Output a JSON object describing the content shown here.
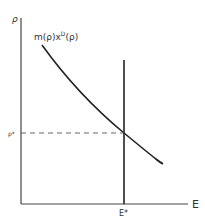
{
  "diagram": {
    "y_axis_label": "ρ",
    "x_axis_label": "E",
    "curve_label": {
      "base": "m(ρ)x",
      "superscript": "D",
      "suffix": "(ρ)"
    },
    "equilibrium_price_label": "ρ*",
    "equilibrium_quantity_label": "E*",
    "colors": {
      "line": "#222222",
      "axis": "#444444",
      "dashed": "#555555",
      "text": "#333333"
    }
  }
}
